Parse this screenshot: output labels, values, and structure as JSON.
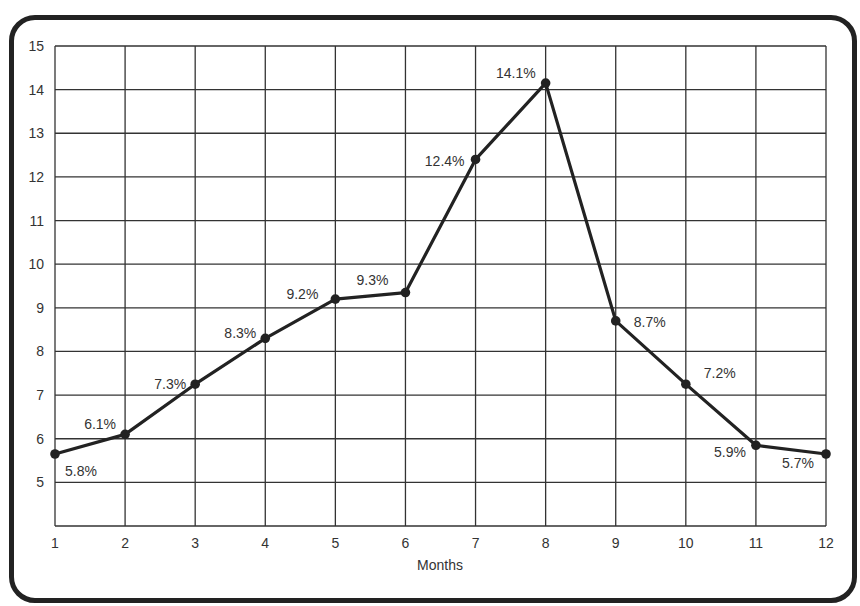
{
  "chart_data": {
    "type": "line",
    "title": "",
    "xlabel": "Months",
    "ylabel": "",
    "x": [
      1,
      2,
      3,
      4,
      5,
      6,
      7,
      8,
      9,
      10,
      11,
      12
    ],
    "xticks": [
      "1",
      "2",
      "3",
      "4",
      "5",
      "6",
      "7",
      "8",
      "9",
      "10",
      "11",
      "12"
    ],
    "yticks": [
      "5",
      "6",
      "7",
      "8",
      "9",
      "10",
      "11",
      "12",
      "13",
      "14",
      "15"
    ],
    "ylim": [
      4,
      15
    ],
    "xlim": [
      1,
      12
    ],
    "grid": true,
    "series": [
      {
        "name": "Rate",
        "values": [
          5.65,
          6.1,
          7.25,
          8.3,
          9.2,
          9.35,
          12.4,
          14.15,
          8.7,
          7.25,
          5.85,
          5.65
        ],
        "labels": [
          "5.8%",
          "6.1%",
          "7.3%",
          "8.3%",
          "9.2%",
          "9.3%",
          "12.4%",
          "14.1%",
          "8.7%",
          "7.2%",
          "5.9%",
          "5.7%"
        ],
        "color": "#222222"
      }
    ]
  }
}
